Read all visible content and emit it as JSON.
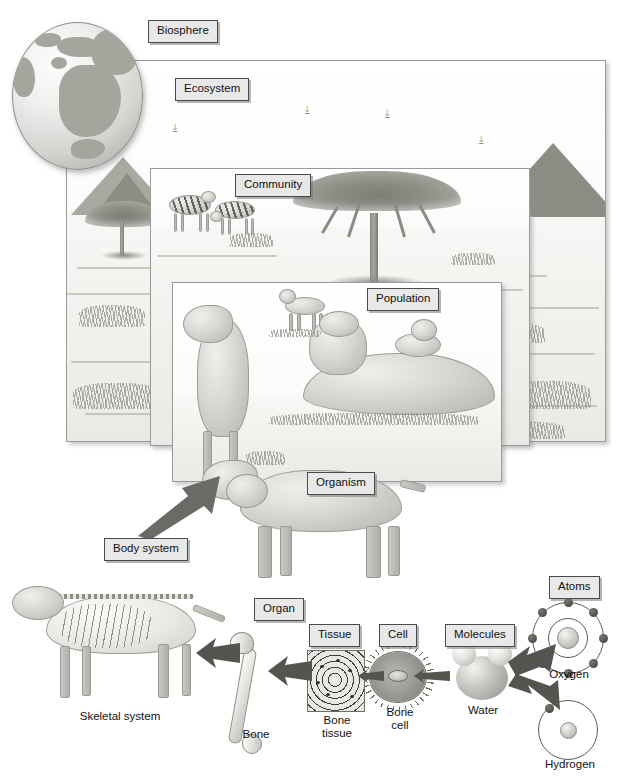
{
  "diagram": {
    "type": "biology-hierarchy-illustration",
    "background_color": "#ffffff",
    "label_box_color": "#e8e8e8",
    "label_border_color": "#4a4a4a"
  },
  "labels": {
    "biosphere": "Biosphere",
    "ecosystem": "Ecosystem",
    "community": "Community",
    "population": "Population",
    "organism": "Organism",
    "body_system": "Body system",
    "organ": "Organ",
    "tissue": "Tissue",
    "cell": "Cell",
    "molecules": "Molecules",
    "atoms": "Atoms"
  },
  "captions": {
    "skeletal_system": "Skeletal system",
    "bone": "Bone",
    "bone_tissue": "Bone\ntissue",
    "bone_cell": "Bone\ncell",
    "water": "Water",
    "oxygen": "Oxygen",
    "hydrogen": "Hydrogen"
  },
  "scenes": {
    "biosphere": {
      "subject": "globe showing Africa, Europe and Asia"
    },
    "ecosystem": {
      "subject": "savanna landscape with mountains, acacia trees, grass and birds in the sky"
    },
    "community": {
      "subject": "savanna with two zebras, acacia tree and grass"
    },
    "population": {
      "subject": "group of lions resting on the savanna"
    },
    "organism": {
      "subject": "single lioness standing"
    },
    "body_system": {
      "subject": "lion skeletal system"
    },
    "organ": {
      "subject": "femur bone"
    },
    "tissue": {
      "subject": "bone tissue with concentric osteon rings"
    },
    "cell": {
      "subject": "bone cell (osteocyte) with spiny projections"
    },
    "molecules": {
      "subject": "water molecule H2O, one oxygen sphere and two hydrogen spheres"
    },
    "atoms": {
      "subject": "oxygen atom with two electron shells and hydrogen atom with one electron"
    }
  },
  "atom_models": {
    "oxygen": {
      "shells": 2,
      "electrons_inner": 2,
      "electrons_outer": 6
    },
    "hydrogen": {
      "shells": 1,
      "electrons_inner": 1
    }
  },
  "arrows": [
    {
      "name": "organ-to-body-system",
      "direction": "left"
    },
    {
      "name": "tissue-to-organ",
      "direction": "left"
    },
    {
      "name": "cell-to-tissue",
      "direction": "left"
    },
    {
      "name": "molecules-to-cell",
      "direction": "left"
    },
    {
      "name": "atoms-to-molecules-upper",
      "direction": "left"
    },
    {
      "name": "atoms-to-molecules-lower",
      "direction": "left"
    },
    {
      "name": "body-system-to-organism",
      "direction": "up-right"
    }
  ]
}
